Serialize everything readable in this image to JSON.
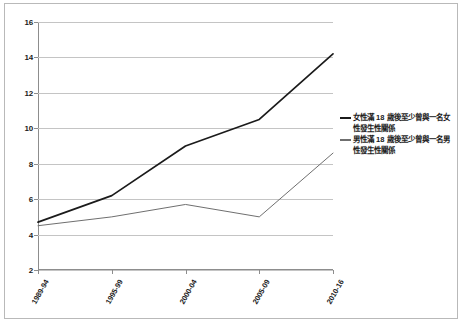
{
  "chart_data": {
    "type": "line",
    "title": "",
    "subtitle": "",
    "xlabel": "",
    "ylabel": "",
    "categories": [
      "1989-94",
      "1995-99",
      "2000-04",
      "2005-09",
      "2010-16"
    ],
    "series": [
      {
        "name": "女性滿 18 歲後至少曾與一名女性發生性關係",
        "color": "#1b1b1b",
        "values": [
          4.7,
          6.2,
          9.0,
          10.5,
          14.2
        ]
      },
      {
        "name": "男性滿 18 歲後至少曾與一名男性發生性關係",
        "color": "#6f6f6f",
        "values": [
          4.5,
          5.0,
          5.7,
          5.0,
          8.6
        ]
      }
    ],
    "ylim": [
      2,
      16
    ],
    "yticks": [
      2,
      4,
      6,
      8,
      10,
      12,
      14,
      16
    ],
    "ytick_labels": [
      "2",
      "4",
      "6",
      "8",
      "10",
      "12",
      "14",
      "16"
    ],
    "grid": true,
    "legend_position": "right"
  },
  "legend": {
    "entries": [
      {
        "label": "女性滿 18 歲後至少曾與一名女性發生性關係"
      },
      {
        "label": "男性滿 18 歲後至少曾與一名男性發生性關係"
      }
    ]
  }
}
